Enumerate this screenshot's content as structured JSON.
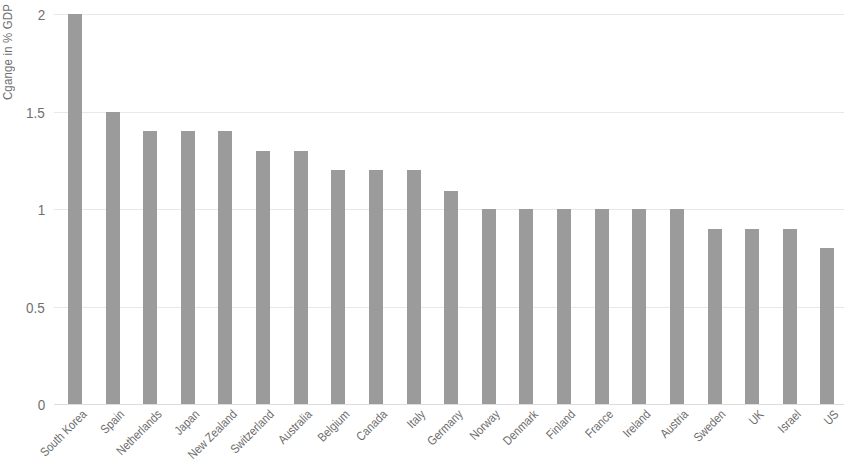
{
  "chart_data": {
    "type": "bar",
    "title": "",
    "subtitle": "",
    "xlabel": "",
    "ylabel": "Cgange in % GDP",
    "ylim": [
      0,
      2
    ],
    "yticks": [
      0,
      0.5,
      1,
      1.5,
      2
    ],
    "ytick_labels": [
      "0",
      "0.5",
      "1",
      "1.5",
      "2"
    ],
    "grid": true,
    "legend": false,
    "bar_color": "#9b9b9b",
    "categories": [
      "South Korea",
      "Spain",
      "Netherlands",
      "Japan",
      "New Zealand",
      "Switzerland",
      "Australia",
      "Belgium",
      "Canada",
      "Italy",
      "Germany",
      "Norway",
      "Denmark",
      "Finland",
      "France",
      "Ireland",
      "Austria",
      "Sweden",
      "UK",
      "Israel",
      "US"
    ],
    "values": [
      2.0,
      1.5,
      1.4,
      1.4,
      1.4,
      1.3,
      1.3,
      1.2,
      1.2,
      1.2,
      1.09,
      1.0,
      1.0,
      1.0,
      1.0,
      1.0,
      1.0,
      0.9,
      0.9,
      0.9,
      0.8
    ]
  }
}
